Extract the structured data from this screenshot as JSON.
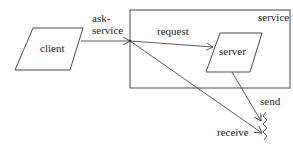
{
  "diagram": {
    "nodes": {
      "client": {
        "label": "client",
        "shape": "parallelogram"
      },
      "server": {
        "label": "server",
        "shape": "parallelogram"
      },
      "service": {
        "label": "service",
        "shape": "rectangle-container"
      }
    },
    "edges": {
      "ask_service": {
        "label_line1": "ask-",
        "label_line2": "service",
        "from": "client",
        "to": "service"
      },
      "request": {
        "label": "request",
        "from": "service-port",
        "to": "server"
      },
      "send": {
        "label": "send",
        "from": "server",
        "to": "lost-signal"
      },
      "receive": {
        "label": "receive",
        "from": "service-port",
        "to": "lost-signal"
      }
    },
    "terminal": {
      "icon": "zigzag-lost-icon"
    }
  }
}
